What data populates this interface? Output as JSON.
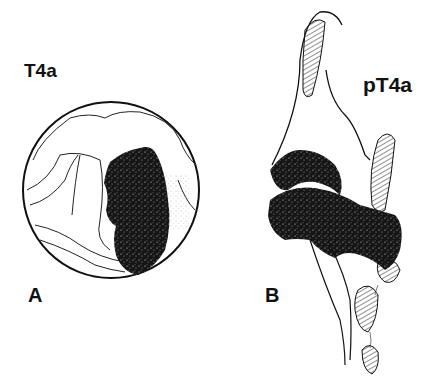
{
  "figure": {
    "panel_a": {
      "letter": "A",
      "stage_label": "T4a",
      "description": "Endoscopic circular view with dark stippled tumor mass"
    },
    "panel_b": {
      "letter": "B",
      "stage_label": "pT4a",
      "description": "Sagittal section with stippled tumor infiltrating hatched cartilage"
    },
    "colors": {
      "background": "#ffffff",
      "ink": "#111111",
      "tumor": "#1a1a1a"
    }
  }
}
